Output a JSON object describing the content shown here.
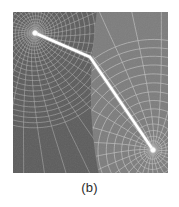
{
  "figure": {
    "caption": "(b)",
    "panel_label": "b",
    "panel": {
      "x": 13,
      "y": 12,
      "width": 155,
      "height": 161
    },
    "colors": {
      "background": "#ffffff",
      "mesh_fill_left": "#5f5f5f",
      "mesh_fill_right": "#7c7c7c",
      "mesh_line": "#b5b5b5",
      "mesh_line_bright": "#cfcfcf",
      "path_stroke": "#ffffff",
      "caption_text": "#2b2b2b"
    }
  },
  "chart_data": {
    "type": "scatter",
    "title": "(b)",
    "xlabel": "",
    "ylabel": "",
    "xlim": [
      0,
      155
    ],
    "ylim": [
      0,
      161
    ],
    "grid": true,
    "legend": "none",
    "annotations": [
      "(b)"
    ],
    "series": [
      {
        "name": "control-path",
        "type": "line",
        "stroke": "#ffffff",
        "width": 2.6,
        "points": [
          {
            "x": 22,
            "y": 21,
            "label": "start-node"
          },
          {
            "x": 77,
            "y": 45,
            "label": "bend-node"
          },
          {
            "x": 140,
            "y": 138,
            "label": "end-node"
          }
        ]
      },
      {
        "name": "path-endpoints",
        "type": "scatter",
        "marker": "circle",
        "fill": "#ffffff",
        "size": 5,
        "points": [
          {
            "x": 22,
            "y": 21
          },
          {
            "x": 140,
            "y": 138
          }
        ]
      }
    ],
    "distortion_centers": [
      {
        "name": "left-vortex-center",
        "x": 22,
        "y": 21,
        "rings": 22,
        "spokes": 40,
        "region": "left"
      },
      {
        "name": "right-vortex-center",
        "x": 140,
        "y": 138,
        "rings": 14,
        "spokes": 28,
        "region": "right"
      }
    ],
    "regions": [
      {
        "name": "left-fine-mesh",
        "x0": 0,
        "x1": 80,
        "cell_density": "fine",
        "fill": "#5f5f5f"
      },
      {
        "name": "right-coarse-mesh",
        "x0": 80,
        "x1": 155,
        "cell_density": "coarse",
        "fill": "#7c7c7c"
      }
    ],
    "seam": {
      "name": "vertical-seam",
      "x": 80,
      "y0": 0,
      "y1": 161
    }
  }
}
